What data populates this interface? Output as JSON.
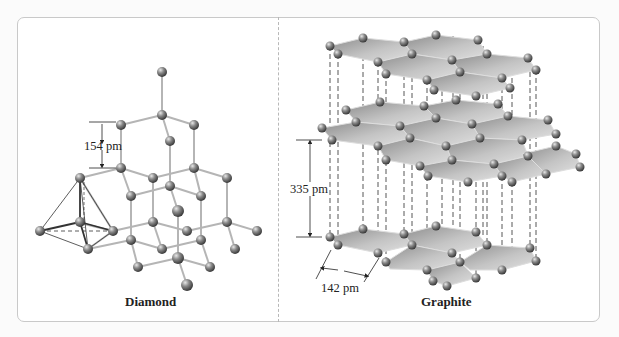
{
  "figure": {
    "panels": [
      {
        "id": "diamond",
        "caption": "Diamond",
        "measurements": [
          {
            "label": "154 pm",
            "meaning": "C–C bond length"
          }
        ]
      },
      {
        "id": "graphite",
        "caption": "Graphite",
        "measurements": [
          {
            "label": "335 pm",
            "meaning": "interlayer spacing"
          },
          {
            "label": "142 pm",
            "meaning": "C–C bond length in layer"
          }
        ]
      }
    ],
    "colors": {
      "atom": "#7a7a7a",
      "bond": "#b0b0b0",
      "sheet": "#a9a9a9",
      "frame_border": "#c9c9c9",
      "divider": "#b8b8b8"
    }
  }
}
